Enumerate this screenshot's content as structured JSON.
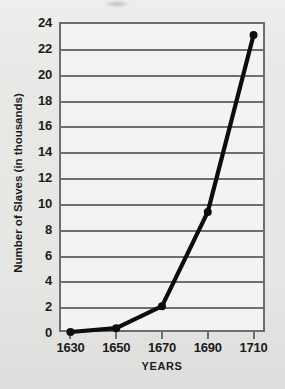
{
  "chart_data": {
    "type": "line",
    "title": "",
    "xlabel": "YEARS",
    "ylabel": "Number of Slaves (in thousands)",
    "x": [
      1630,
      1650,
      1670,
      1690,
      1710
    ],
    "categories": [
      "1630",
      "1650",
      "1670",
      "1690",
      "1710"
    ],
    "values": [
      0,
      0.3,
      2,
      9.3,
      23
    ],
    "series": [
      {
        "name": "Number of Slaves (in thousands)",
        "values": [
          0,
          0.3,
          2,
          9.3,
          23
        ]
      }
    ],
    "xlim": [
      1625,
      1715
    ],
    "ylim": [
      0,
      24
    ],
    "ytick_labels": [
      "0",
      "2",
      "4",
      "6",
      "8",
      "10",
      "12",
      "14",
      "16",
      "18",
      "20",
      "22",
      "24"
    ],
    "ytick_values": [
      0,
      2,
      4,
      6,
      8,
      10,
      12,
      14,
      16,
      18,
      20,
      22,
      24
    ],
    "xtick_labels": [
      "1630",
      "1650",
      "1670",
      "1690",
      "1710"
    ],
    "grid": "horizontal",
    "legend": "none",
    "colors": {
      "line": "#0d0d0d",
      "marker": "#0d0d0d",
      "gridline": "#6e6e6e",
      "axis": "#6e6e6e",
      "plot_background": "#f3f3f1",
      "page_background": "#e8e8e6",
      "text": "#1b1b1b"
    },
    "line_width": 4.2,
    "marker_radius": 4
  }
}
